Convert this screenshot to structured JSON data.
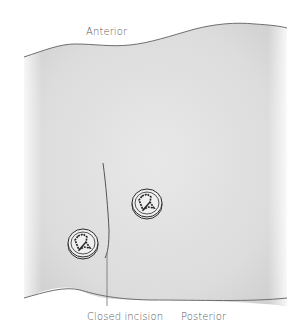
{
  "figure": {
    "labels": {
      "anterior": "Anterior",
      "posterior": "Posterior",
      "incision": "Closed incision"
    },
    "elements": {
      "tissue": "tissue-region",
      "incision": "closed-incision-line",
      "buttons": [
        {
          "name": "suture-button-upper",
          "cx": 147,
          "cy": 203
        },
        {
          "name": "suture-button-lower",
          "cx": 83,
          "cy": 243
        }
      ]
    },
    "colors": {
      "tissue_center": "#e6e6e6",
      "tissue_edge": "#c4c4c4",
      "outline": "#6e6e6e",
      "text": "#5a5a5a"
    }
  }
}
